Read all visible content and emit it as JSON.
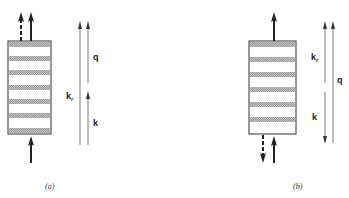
{
  "figure": {
    "colors": {
      "ink": "#222222",
      "stripe": "#b8b8b8",
      "thin_line": "#555555",
      "background": "#ffffff"
    },
    "panels": [
      {
        "id": "a",
        "caption": "(a)",
        "crystal": {
          "stripes": 6
        },
        "labels": {
          "q": "q",
          "kr_main": "k",
          "kr_sub": "r",
          "k": "k"
        },
        "description": "k_r, q and k all point upward; k_r = k + q"
      },
      {
        "id": "b",
        "caption": "(b)",
        "crystal": {
          "stripes": 6
        },
        "labels": {
          "kr_main": "k",
          "kr_sub": "r",
          "k": "k",
          "q": "q"
        },
        "description": "k_r points up, k points down, q points up spanning both"
      }
    ]
  }
}
